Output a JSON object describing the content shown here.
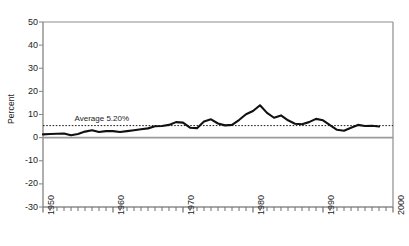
{
  "chart_data": {
    "type": "line",
    "title": "",
    "xlabel": "",
    "ylabel": "Percent",
    "ylim": [
      -30,
      50
    ],
    "xlim": [
      1950,
      2000
    ],
    "yticks": [
      50,
      40,
      30,
      20,
      10,
      0,
      -10,
      -20,
      -30
    ],
    "xticks": [
      1950,
      1960,
      1970,
      1980,
      1990,
      2000
    ],
    "xtick_interval": 1,
    "grid": false,
    "legend": "none",
    "annotations": [
      {
        "text": "Average 5.20%",
        "x": 1954.5,
        "y": 8.0,
        "kind": "average-line-label"
      }
    ],
    "reference_lines": [
      {
        "name": "average",
        "value": 5.2,
        "style": "dotted",
        "color": "#1a1a1a"
      },
      {
        "name": "zero",
        "value": 0,
        "style": "solid",
        "color": "#9a9a9a"
      }
    ],
    "series": [
      {
        "name": "Percent",
        "color": "#111111",
        "x": [
          1950,
          1951,
          1952,
          1953,
          1954,
          1955,
          1956,
          1957,
          1958,
          1959,
          1960,
          1961,
          1962,
          1963,
          1964,
          1965,
          1966,
          1967,
          1968,
          1969,
          1970,
          1971,
          1972,
          1973,
          1974,
          1975,
          1976,
          1977,
          1978,
          1979,
          1980,
          1981,
          1982,
          1983,
          1984,
          1985,
          1986,
          1987,
          1988,
          1989,
          1990,
          1991,
          1992,
          1993,
          1994,
          1995,
          1996,
          1997,
          1998
        ],
        "values": [
          1.4,
          1.6,
          1.7,
          1.8,
          1.0,
          1.6,
          2.6,
          3.2,
          2.4,
          2.8,
          2.8,
          2.4,
          2.8,
          3.2,
          3.6,
          4.0,
          4.9,
          5.0,
          5.5,
          6.7,
          6.5,
          4.3,
          4.1,
          7.0,
          7.9,
          6.1,
          5.3,
          5.5,
          7.6,
          10.1,
          11.5,
          14.0,
          10.7,
          8.6,
          9.6,
          7.5,
          6.0,
          5.8,
          6.7,
          8.1,
          7.5,
          5.4,
          3.4,
          3.0,
          4.3,
          5.5,
          5.0,
          5.1,
          4.8
        ]
      }
    ]
  },
  "plot": {
    "left": 43,
    "right": 393,
    "top": 22,
    "bottom": 207
  }
}
